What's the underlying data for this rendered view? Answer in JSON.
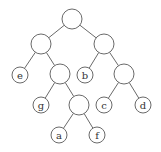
{
  "diagram": {
    "type": "binary-tree",
    "width": 161,
    "height": 152,
    "colors": {
      "stroke": "#6a6a6a",
      "fill": "#ffffff",
      "text": "#333333"
    },
    "nodes": [
      {
        "id": "root",
        "label": "",
        "x": 72,
        "y": 19,
        "r": 10
      },
      {
        "id": "n1",
        "label": "",
        "x": 41,
        "y": 44,
        "r": 10
      },
      {
        "id": "n2",
        "label": "",
        "x": 104,
        "y": 44,
        "r": 10
      },
      {
        "id": "e",
        "label": "e",
        "x": 20,
        "y": 75,
        "r": 8
      },
      {
        "id": "n3",
        "label": "",
        "x": 60,
        "y": 74,
        "r": 10
      },
      {
        "id": "b",
        "label": "b",
        "x": 85,
        "y": 75,
        "r": 8
      },
      {
        "id": "n4",
        "label": "",
        "x": 124,
        "y": 74,
        "r": 10
      },
      {
        "id": "g",
        "label": "g",
        "x": 41,
        "y": 105,
        "r": 8
      },
      {
        "id": "n5",
        "label": "",
        "x": 79,
        "y": 105,
        "r": 10
      },
      {
        "id": "c",
        "label": "c",
        "x": 104,
        "y": 105,
        "r": 8
      },
      {
        "id": "d",
        "label": "d",
        "x": 143,
        "y": 105,
        "r": 8
      },
      {
        "id": "a",
        "label": "a",
        "x": 59,
        "y": 135,
        "r": 8
      },
      {
        "id": "f",
        "label": "f",
        "x": 97,
        "y": 135,
        "r": 8
      }
    ],
    "edges": [
      [
        "root",
        "n1"
      ],
      [
        "root",
        "n2"
      ],
      [
        "n1",
        "e"
      ],
      [
        "n1",
        "n3"
      ],
      [
        "n2",
        "b"
      ],
      [
        "n2",
        "n4"
      ],
      [
        "n3",
        "g"
      ],
      [
        "n3",
        "n5"
      ],
      [
        "n4",
        "c"
      ],
      [
        "n4",
        "d"
      ],
      [
        "n5",
        "a"
      ],
      [
        "n5",
        "f"
      ]
    ]
  }
}
